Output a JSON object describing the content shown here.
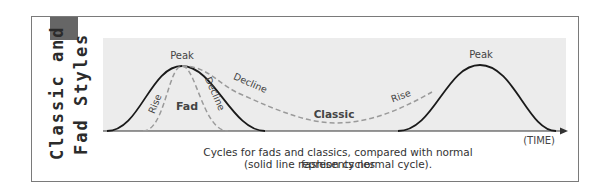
{
  "title": {
    "line1": "Classic and",
    "line2": "Fad Styles"
  },
  "diagram": {
    "labels": {
      "peak1": "Peak",
      "peak2": "Peak",
      "fad_rise": "Rise",
      "fad": "Fad",
      "fad_decline": "Decline",
      "classic_decline": "Decline",
      "classic": "Classic",
      "classic_rise": "Rise",
      "time_axis": "(TIME)"
    },
    "legend": {
      "solid": "normal fashion cycle",
      "dashed_fad": "fad cycle",
      "dashed_classic": "classic cycle"
    },
    "colors": {
      "panel": "#ececec",
      "solid_line": "#1a1a1a",
      "dashed_line": "#9a9a9a",
      "accent_block": "#666666"
    }
  },
  "caption": {
    "line1": "Cycles for fads and classics, compared with normal fashion cycles",
    "line2": "(solid line represents normal cycle)."
  }
}
